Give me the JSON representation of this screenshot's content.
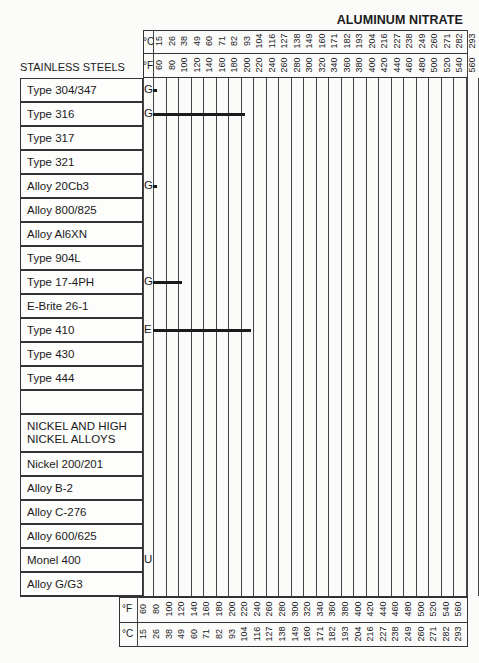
{
  "chart_data": {
    "type": "table",
    "title": "ALUMINUM NITRATE",
    "section_headers": [
      "STAINLESS STEELS",
      "NICKEL AND HIGH NICKEL ALLOYS"
    ],
    "x_axis": {
      "unit_f_label": "°F",
      "unit_c_label": "°C",
      "fahrenheit": [
        60,
        80,
        100,
        120,
        140,
        160,
        180,
        200,
        220,
        240,
        260,
        280,
        300,
        320,
        340,
        360,
        380,
        400,
        420,
        440,
        460,
        480,
        500,
        520,
        540,
        560
      ],
      "celsius": [
        15,
        26,
        38,
        49,
        60,
        71,
        82,
        93,
        104,
        116,
        127,
        138,
        149,
        160,
        171,
        182,
        193,
        204,
        216,
        227,
        238,
        249,
        260,
        271,
        282,
        293
      ]
    },
    "rows": [
      {
        "label": "Type 304/347",
        "rating": "G",
        "max_temp_f": 60
      },
      {
        "label": "Type 316",
        "rating": "G",
        "max_temp_f": 200
      },
      {
        "label": "Type 317",
        "rating": "",
        "max_temp_f": null
      },
      {
        "label": "Type 321",
        "rating": "",
        "max_temp_f": null
      },
      {
        "label": "Alloy 20Cb3",
        "rating": "G",
        "max_temp_f": 60
      },
      {
        "label": "Alloy 800/825",
        "rating": "",
        "max_temp_f": null
      },
      {
        "label": "Alloy Al6XN",
        "rating": "",
        "max_temp_f": null
      },
      {
        "label": "Type 904L",
        "rating": "",
        "max_temp_f": null
      },
      {
        "label": "Type 17-4PH",
        "rating": "G",
        "max_temp_f": 100
      },
      {
        "label": "E-Brite 26-1",
        "rating": "",
        "max_temp_f": null
      },
      {
        "label": "Type 410",
        "rating": "E",
        "max_temp_f": 210
      },
      {
        "label": "Type 430",
        "rating": "",
        "max_temp_f": null
      },
      {
        "label": "Type 444",
        "rating": "",
        "max_temp_f": null
      },
      {
        "label": "",
        "rating": "",
        "max_temp_f": null
      },
      {
        "label": "NICKEL AND HIGH NICKEL ALLOYS",
        "rating": "",
        "max_temp_f": null,
        "section": true
      },
      {
        "label": "Nickel 200/201",
        "rating": "",
        "max_temp_f": null
      },
      {
        "label": "Alloy B-2",
        "rating": "",
        "max_temp_f": null
      },
      {
        "label": "Alloy C-276",
        "rating": "",
        "max_temp_f": null
      },
      {
        "label": "Alloy 600/625",
        "rating": "",
        "max_temp_f": null
      },
      {
        "label": "Monel 400",
        "rating": "U",
        "max_temp_f": null
      },
      {
        "label": "Alloy G/G3",
        "rating": "",
        "max_temp_f": null
      }
    ]
  }
}
